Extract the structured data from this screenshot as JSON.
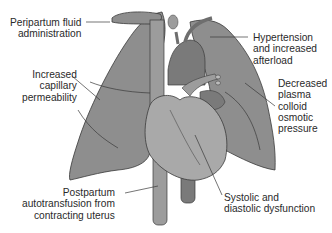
{
  "diagram": {
    "colors": {
      "background": "#ffffff",
      "lung_fill": "#8e8e8e",
      "heart_fill": "#a9a9a9",
      "vessel_dark": "#7a7a7a",
      "vessel_fill": "#9c9c9c",
      "outline": "#3a3a3a",
      "text": "#2a2a2a",
      "leader_line": "#3a3a3a"
    },
    "labels": {
      "peripartum_fluid": "Peripartum fluid\nadministration",
      "increased_capillary": "Increased\ncapillary\npermeability",
      "postpartum_autotransfusion": "Postpartum\nautotransfusion from\ncontracting uterus",
      "hypertension_afterload": "Hypertension\nand increased\nafterload",
      "decreased_oncotic": "Decreased\nplasma\ncolloid\nosmotic\npressure",
      "systolic_diastolic": "Systolic and\ndiastolic dysfunction"
    },
    "structures": [
      "left-lung",
      "right-lung",
      "heart",
      "superior-vena-cava",
      "inferior-vena-cava",
      "descending-aorta",
      "aortic-arch",
      "pulmonary-artery"
    ]
  }
}
